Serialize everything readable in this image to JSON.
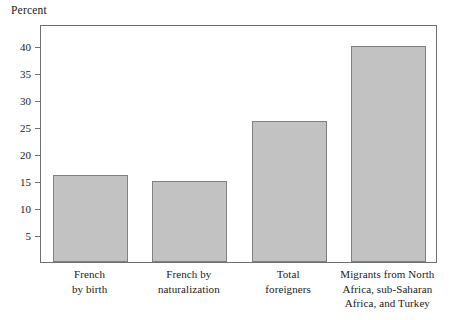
{
  "chart_data": {
    "type": "bar",
    "title": "",
    "ylabel": "Percent",
    "xlabel": "",
    "categories": [
      "French\nby birth",
      "French by\nnaturalization",
      "Total\nforeigners",
      "Migrants from North\nAfrica, sub-Saharan\nAfrica, and Turkey"
    ],
    "values": [
      16,
      15,
      26,
      40
    ],
    "ylim": [
      0,
      44
    ],
    "yticks": [
      5,
      10,
      15,
      20,
      25,
      30,
      35,
      40
    ],
    "ytick_labels": [
      "5",
      "10",
      "15",
      "20",
      "25",
      "30",
      "35",
      "40"
    ],
    "grid": false,
    "legend": null,
    "bar_color": "#c2c2c2",
    "bar_border_color": "#808080",
    "axis_color": "#6f6f6f",
    "background": "#ffffff"
  }
}
